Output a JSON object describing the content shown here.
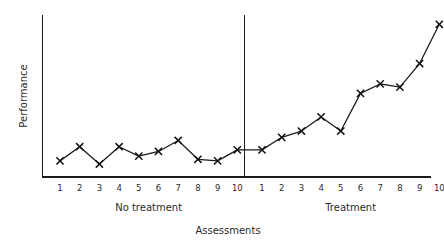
{
  "chart_data": {
    "type": "line",
    "title": "",
    "xlabel": "Assessments",
    "ylabel": "Performance",
    "grid": false,
    "legend": null,
    "axis": {
      "x_range": [
        0,
        21
      ],
      "y_range": [
        0,
        100
      ],
      "y_ticks_shown": false,
      "x_ticks_shown": true
    },
    "phases": [
      {
        "name": "No treatment",
        "label": "No treatment",
        "x_labels": [
          "1",
          "2",
          "3",
          "4",
          "5",
          "6",
          "7",
          "8",
          "9",
          "10"
        ],
        "values": [
          9,
          18,
          7,
          18,
          12,
          15,
          22,
          10,
          9,
          16
        ]
      },
      {
        "name": "Treatment",
        "label": "Treatment",
        "x_labels": [
          "1",
          "2",
          "3",
          "4",
          "5",
          "6",
          "7",
          "8",
          "9",
          "10"
        ],
        "values": [
          16,
          24,
          28,
          37,
          28,
          52,
          58,
          56,
          71,
          96
        ]
      }
    ],
    "phase_change_line": {
      "after_point": 10,
      "style": "solid-vertical"
    },
    "marker": "x",
    "colors": {
      "line": "#1a1a1a",
      "marker": "#111111",
      "axis": "#1a1a1a",
      "text": "#2b2b2b",
      "background": "#ffffff"
    }
  },
  "figure": {
    "xlabel": "Assessments",
    "ylabel": "Performance",
    "phase_a_label": "No treatment",
    "phase_b_label": "Treatment"
  }
}
